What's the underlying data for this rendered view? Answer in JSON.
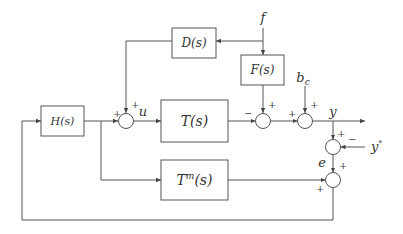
{
  "diagram": {
    "type": "block-diagram",
    "colors": {
      "line": "#555555",
      "background": "#ffffff",
      "text": "#333333"
    },
    "blocks": {
      "D": {
        "label": "D(s)"
      },
      "F": {
        "label": "F(s)"
      },
      "H": {
        "label": "H(s)"
      },
      "T": {
        "label": "T(s)"
      },
      "Tm": {
        "label_base": "T",
        "label_sup": "m",
        "label_tail": "(s)"
      }
    },
    "signals": {
      "f": "f",
      "u": "u",
      "bc_base": "b",
      "bc_sub": "c",
      "y": "y",
      "ystar_base": "y",
      "ystar_sup": "*",
      "e": "e"
    },
    "signs": {
      "sum1_left": "+",
      "sum1_top": "+",
      "sum2_left": "−",
      "sum2_top": "+",
      "sum3_left": "+",
      "sum3_top": "+",
      "sum4_top": "+",
      "sum4_right": "−",
      "sum5_top": "+",
      "sum5_left": "+"
    }
  }
}
